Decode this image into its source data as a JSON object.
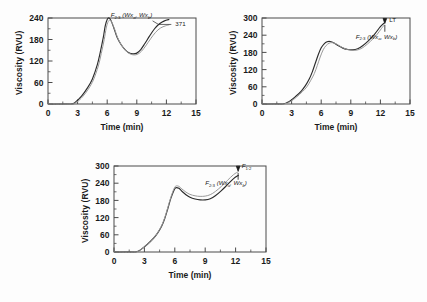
{
  "figure": {
    "background": "#fdfdfd",
    "curve_colors": {
      "dark": "#2b2b2b",
      "light": "#9a9a9a"
    },
    "axis_color": "#4a4a4a"
  },
  "chart_data": [
    {
      "type": "line",
      "panel": "a",
      "title": "",
      "xlabel": "Time (min)",
      "ylabel": "Viscosity (RVU)",
      "xlim": [
        0,
        15
      ],
      "ylim": [
        0,
        240
      ],
      "xticks": [
        "0",
        "3",
        "6",
        "9",
        "12",
        "15"
      ],
      "yticks": [
        "0",
        "60",
        "120",
        "180",
        "240"
      ],
      "grid": false,
      "legend": "none",
      "annotations": [
        {
          "name": "genotype-label",
          "text": "F",
          "sub": "2:3",
          "paren": "(Wx",
          "paren_sub": "a",
          "paren2": ", Wx",
          "paren2_sub": "b",
          "paren3": ")"
        },
        {
          "name": "line-number-label",
          "text": "371"
        }
      ],
      "series": [
        {
          "name": "sample-dark",
          "color": "#2b2b2b",
          "x": [
            0,
            2.3,
            2.8,
            3.4,
            4.0,
            4.5,
            5.0,
            5.3,
            5.6,
            5.8,
            6.0,
            6.2,
            6.4,
            6.7,
            7.0,
            7.4,
            7.8,
            8.2,
            8.6,
            9.0,
            9.4,
            9.8,
            10.3,
            10.8,
            11.3,
            11.8,
            12.3
          ],
          "y": [
            0,
            0,
            6,
            22,
            45,
            70,
            110,
            145,
            185,
            218,
            236,
            240,
            232,
            210,
            186,
            166,
            152,
            143,
            140,
            142,
            152,
            168,
            190,
            210,
            224,
            232,
            236
          ]
        },
        {
          "name": "sample-light",
          "color": "#9a9a9a",
          "x": [
            0,
            2.35,
            2.9,
            3.5,
            4.1,
            4.6,
            5.1,
            5.4,
            5.7,
            5.9,
            6.1,
            6.3,
            6.5,
            6.8,
            7.1,
            7.5,
            7.9,
            8.3,
            8.7,
            9.1,
            9.5,
            9.9,
            10.4,
            10.9,
            11.4,
            11.9,
            12.3
          ],
          "y": [
            0,
            0,
            5,
            20,
            42,
            67,
            106,
            141,
            180,
            212,
            230,
            234,
            226,
            205,
            182,
            162,
            148,
            140,
            137,
            139,
            148,
            162,
            182,
            200,
            212,
            218,
            221
          ]
        }
      ]
    },
    {
      "type": "line",
      "panel": "b",
      "title": "",
      "xlabel": "Time (min)",
      "ylabel": "Viscosity (RVU)",
      "xlim": [
        0,
        15
      ],
      "ylim": [
        0,
        300
      ],
      "xticks": [
        "0",
        "3",
        "6",
        "9",
        "12",
        "15"
      ],
      "yticks": [
        "0",
        "60",
        "120",
        "180",
        "240",
        "300"
      ],
      "grid": false,
      "legend": "none",
      "annotations": [
        {
          "name": "lt-label",
          "text": "LT"
        },
        {
          "name": "genotype-label",
          "text": "F",
          "sub": "2:3",
          "paren": "(Wx",
          "paren_sub": "a",
          "paren2": ", Wx",
          "paren2_sub": "b",
          "paren3": ")"
        }
      ],
      "series": [
        {
          "name": "sample-dark",
          "color": "#2b2b2b",
          "x": [
            0,
            2.1,
            2.8,
            3.4,
            4.0,
            4.4,
            4.8,
            5.1,
            5.4,
            5.7,
            6.0,
            6.3,
            6.6,
            6.9,
            7.3,
            7.7,
            8.2,
            8.7,
            9.2,
            9.7,
            10.2,
            10.8,
            11.4,
            12.0,
            12.4
          ],
          "y": [
            0,
            0,
            10,
            26,
            46,
            64,
            88,
            112,
            142,
            172,
            196,
            210,
            217,
            218,
            213,
            204,
            195,
            190,
            189,
            193,
            203,
            221,
            243,
            270,
            283
          ]
        },
        {
          "name": "sample-light",
          "color": "#9a9a9a",
          "x": [
            0,
            2.15,
            2.9,
            3.5,
            4.1,
            4.55,
            4.95,
            5.3,
            5.6,
            5.9,
            6.2,
            6.5,
            6.8,
            7.1,
            7.5,
            7.9,
            8.4,
            8.9,
            9.4,
            9.9,
            10.4,
            11.0,
            11.6,
            12.1,
            12.4
          ],
          "y": [
            0,
            0,
            9,
            24,
            43,
            60,
            83,
            106,
            134,
            164,
            189,
            204,
            212,
            214,
            210,
            202,
            193,
            188,
            187,
            191,
            201,
            219,
            240,
            263,
            276
          ]
        }
      ]
    },
    {
      "type": "line",
      "panel": "c",
      "title": "",
      "xlabel": "Time (min)",
      "ylabel": "Viscosity (RVU)",
      "xlim": [
        0,
        15
      ],
      "ylim": [
        0,
        300
      ],
      "xticks": [
        "0",
        "3",
        "6",
        "9",
        "12",
        "15"
      ],
      "yticks": [
        "0",
        "60",
        "120",
        "180",
        "240",
        "300"
      ],
      "grid": false,
      "legend": "none",
      "annotations": [
        {
          "name": "f12-label",
          "text": "F",
          "sub": "1:2"
        },
        {
          "name": "genotype-label",
          "text": "F",
          "sub": "2:3",
          "paren": "(Wx",
          "paren_sub": "a",
          "paren2": ", Wx",
          "paren2_sub": "b",
          "paren3": ")"
        }
      ],
      "series": [
        {
          "name": "sample-dark",
          "color": "#2b2b2b",
          "x": [
            0,
            2.1,
            2.7,
            3.3,
            3.9,
            4.3,
            4.7,
            5.0,
            5.3,
            5.6,
            5.9,
            6.1,
            6.4,
            6.7,
            7.1,
            7.5,
            8.0,
            8.5,
            9.0,
            9.5,
            10.0,
            10.6,
            11.2,
            11.8,
            12.3
          ],
          "y": [
            0,
            0,
            10,
            27,
            48,
            66,
            90,
            116,
            150,
            186,
            214,
            224,
            222,
            212,
            200,
            191,
            185,
            182,
            182,
            186,
            196,
            214,
            235,
            256,
            268
          ]
        },
        {
          "name": "sample-light",
          "color": "#9a9a9a",
          "x": [
            0,
            2.1,
            2.7,
            3.3,
            3.9,
            4.3,
            4.7,
            5.0,
            5.3,
            5.6,
            5.9,
            6.1,
            6.4,
            6.7,
            7.1,
            7.5,
            8.0,
            8.5,
            9.0,
            9.5,
            10.0,
            10.6,
            11.2,
            11.8,
            12.3
          ],
          "y": [
            0,
            0,
            10,
            27,
            48,
            67,
            92,
            119,
            154,
            190,
            219,
            230,
            229,
            220,
            209,
            201,
            196,
            194,
            195,
            200,
            211,
            229,
            250,
            270,
            281
          ]
        }
      ]
    }
  ]
}
